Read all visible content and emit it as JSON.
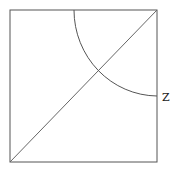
{
  "diagram": {
    "square": {
      "x": 10,
      "y": 10,
      "width": 147,
      "height": 152,
      "stroke": "#555555"
    },
    "diagonal": {
      "x1": 10,
      "y1": 162,
      "x2": 157,
      "y2": 10,
      "stroke": "#666666"
    },
    "arc": {
      "center": [
        157,
        10
      ],
      "start": [
        74,
        10
      ],
      "end": [
        157,
        96
      ],
      "stroke": "#555555"
    },
    "labels": [
      {
        "text": "Z",
        "x": 162,
        "y": 101
      }
    ]
  }
}
